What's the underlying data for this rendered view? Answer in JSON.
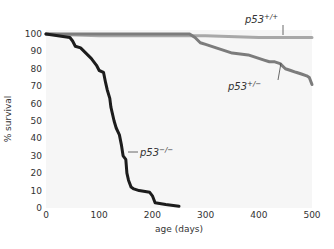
{
  "chart_data": {
    "type": "line",
    "title": "",
    "xlabel": "age (days)",
    "ylabel": "% survival",
    "xlim": [
      0,
      500
    ],
    "ylim": [
      0,
      100
    ],
    "x_ticks": [
      0,
      100,
      200,
      300,
      400,
      500
    ],
    "y_ticks": [
      0,
      10,
      20,
      30,
      40,
      50,
      60,
      70,
      80,
      90,
      100
    ],
    "grid": false,
    "legend": "inline labels",
    "plot_background": "#f6f6f6",
    "series": [
      {
        "name": "p53+/+",
        "label_base": "p53",
        "label_sup": "+/+",
        "color": "#a8a8a8",
        "x": [
          0,
          100,
          200,
          300,
          400,
          500
        ],
        "y": [
          100,
          99,
          99,
          99,
          98,
          98
        ]
      },
      {
        "name": "p53+/-",
        "label_base": "p53",
        "label_sup": "+/−",
        "color": "#7c7c7c",
        "x": [
          0,
          270,
          280,
          290,
          300,
          320,
          340,
          350,
          380,
          400,
          410,
          420,
          430,
          440,
          450,
          460,
          470,
          480,
          490,
          495,
          500
        ],
        "y": [
          100,
          100,
          98,
          95,
          94,
          92,
          90,
          89,
          88,
          86,
          85,
          84,
          84,
          83,
          80,
          79,
          78,
          77,
          76,
          75,
          71
        ]
      },
      {
        "name": "p53-/-",
        "label_base": "p53",
        "label_sup": "−/−",
        "color": "#1c1c1c",
        "x": [
          0,
          45,
          50,
          55,
          65,
          75,
          85,
          95,
          100,
          108,
          112,
          115,
          120,
          122,
          128,
          132,
          138,
          142,
          145,
          150,
          152,
          155,
          160,
          165,
          175,
          195,
          200,
          205,
          225,
          250
        ],
        "y": [
          100,
          98,
          96,
          93,
          92,
          89,
          86,
          82,
          79,
          78,
          72,
          68,
          63,
          58,
          50,
          46,
          42,
          36,
          30,
          28,
          20,
          16,
          12,
          11,
          10,
          9,
          7,
          3,
          2,
          1
        ]
      }
    ]
  }
}
